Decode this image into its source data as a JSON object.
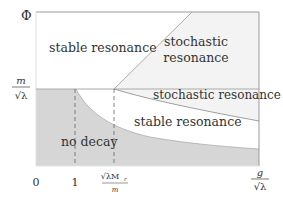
{
  "diagram": {
    "y_axis_label": "Φ",
    "y_tick": {
      "num": "m",
      "den": "√λ"
    },
    "x_ticks": [
      {
        "label": "0"
      },
      {
        "label": "1"
      },
      {
        "num": "√λM",
        "sub": "r",
        "den": "m"
      }
    ],
    "x_axis_label": {
      "num": "g",
      "den": "√λ"
    },
    "regions": {
      "stable_upper": "stable resonance",
      "stochastic_upper_line1": "stochastic",
      "stochastic_upper_line2": "resonance",
      "stochastic_band": "stochastic resonance",
      "stable_lower": "stable resonance",
      "no_decay": "no decay"
    },
    "colors": {
      "no_decay_fill": "#d4d4d4",
      "stochastic_fill": "#f2f2f2",
      "line": "#888888",
      "text": "#333333"
    }
  }
}
